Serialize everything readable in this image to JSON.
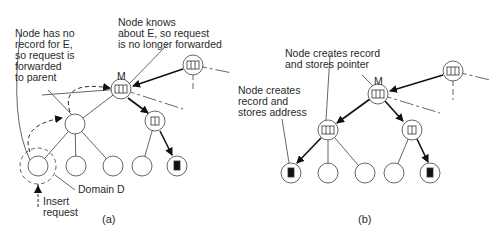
{
  "panel_a": {
    "caption": "(a)",
    "labels": {
      "no_record": "Node has no\nrecord for E,\nso request is\nforwarded\nto parent",
      "knows": "Node knows\nabout E, so request\nis no longer forwarded",
      "m": "M",
      "domain": "Domain D",
      "insert": "Insert\nrequest"
    }
  },
  "panel_b": {
    "caption": "(b)",
    "labels": {
      "stores_pointer": "Node creates record\nand stores pointer",
      "stores_address": "Node creates\nrecord and\nstores address",
      "m": "M"
    }
  },
  "colors": {
    "line": "#444444",
    "arrow": "#111111",
    "record": "#111111"
  }
}
